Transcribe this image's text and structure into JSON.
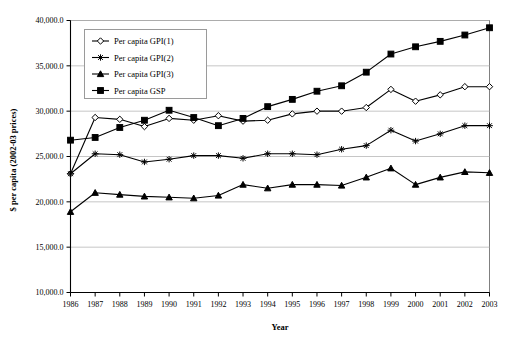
{
  "chart_data": {
    "type": "line",
    "title": "",
    "xlabel": "Year",
    "ylabel": "$ per capita (2002-03 prices)",
    "xlim": [
      1986,
      2003
    ],
    "ylim": [
      10000,
      40000
    ],
    "ytick_step": 5000,
    "grid": true,
    "legend_position": "upper-left-inside",
    "categories": [
      1986,
      1987,
      1988,
      1989,
      1990,
      1991,
      1992,
      1993,
      1994,
      1995,
      1996,
      1997,
      1998,
      1999,
      2000,
      2001,
      2002,
      2003
    ],
    "xticklabels": [
      "1986",
      "1987",
      "1988",
      "1989",
      "1990",
      "1991",
      "1992",
      "1993",
      "1994",
      "1995",
      "1996",
      "1997",
      "1998",
      "1999",
      "2000",
      "2001",
      "2002",
      "2003"
    ],
    "yticklabels": [
      "10,000.0",
      "15,000.0",
      "20,000.0",
      "25,000.0",
      "30,000.0",
      "35,000.0",
      "40,000.0"
    ],
    "ytickvalues": [
      10000,
      15000,
      20000,
      25000,
      30000,
      35000,
      40000
    ],
    "series": [
      {
        "name": "Per capita GPI(1)",
        "marker": "open-diamond",
        "values": [
          23100,
          29300,
          29100,
          28300,
          29200,
          29000,
          29500,
          28900,
          29000,
          29700,
          30000,
          30000,
          30400,
          32400,
          31100,
          31800,
          32700,
          32700
        ]
      },
      {
        "name": "Per capita GPI(2)",
        "marker": "open-star",
        "values": [
          23100,
          25300,
          25200,
          24400,
          24700,
          25100,
          25100,
          24800,
          25300,
          25300,
          25200,
          25800,
          26200,
          27900,
          26700,
          27500,
          28400,
          28400
        ]
      },
      {
        "name": "Per capita GPI(3)",
        "marker": "solid-triangle",
        "values": [
          18900,
          21000,
          20800,
          20600,
          20500,
          20400,
          20700,
          21900,
          21500,
          21900,
          21900,
          21800,
          22700,
          23700,
          21900,
          22700,
          23300,
          23200
        ]
      },
      {
        "name": "Per capita GSP",
        "marker": "solid-square",
        "values": [
          26800,
          27100,
          28200,
          29000,
          30100,
          29300,
          28400,
          29200,
          30500,
          31300,
          32200,
          32800,
          34300,
          36300,
          37100,
          37700,
          38400,
          39200
        ]
      }
    ]
  },
  "legend": {
    "items": [
      {
        "label": "Per capita GPI(1)"
      },
      {
        "label": "Per capita GPI(2)"
      },
      {
        "label": "Per capita GPI(3)"
      },
      {
        "label": "Per capita GSP"
      }
    ]
  },
  "colors": {
    "line": "#000000",
    "grid": "#b8b8b8",
    "frame": "#808080",
    "background": "#ffffff"
  }
}
